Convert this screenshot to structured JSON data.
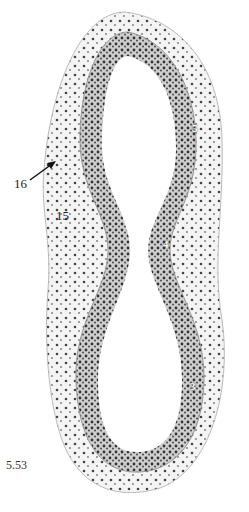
{
  "figure": {
    "number": "5.53",
    "labels": {
      "l16": "16",
      "l15": "15",
      "l5": "5",
      "l4": "4",
      "l3": "3"
    }
  }
}
